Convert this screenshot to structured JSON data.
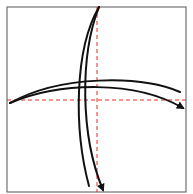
{
  "diagram": {
    "type": "origami-fold-diagram",
    "paper": {
      "x": 7,
      "y": 7,
      "width": 179,
      "height": 185,
      "stroke": "#555555",
      "fill": "#ffffff"
    },
    "fold_lines": [
      {
        "name": "vertical-valley-fold",
        "x1": 97,
        "y1": 7,
        "x2": 97,
        "y2": 192,
        "color": "#e0301e",
        "style": "dashed"
      },
      {
        "name": "horizontal-valley-fold",
        "x1": 7,
        "y1": 100,
        "x2": 186,
        "y2": 100,
        "color": "#e0301e",
        "style": "dashed"
      }
    ],
    "arrows": [
      {
        "name": "fold-arrow-down-outer",
        "path": "M99 7 C 74 50, 74 130, 89 186",
        "arrowhead": false
      },
      {
        "name": "fold-arrow-down-inner",
        "path": "M99 7 C 80 55, 80 135, 103 190",
        "arrowhead": true
      },
      {
        "name": "fold-arrow-right-upper",
        "path": "M10 103 C 60 75, 140 75, 180 92",
        "arrowhead": false
      },
      {
        "name": "fold-arrow-right-lower",
        "path": "M10 103 C 60 82, 135 80, 183 108",
        "arrowhead": true
      }
    ],
    "stroke_color": "#111111"
  }
}
